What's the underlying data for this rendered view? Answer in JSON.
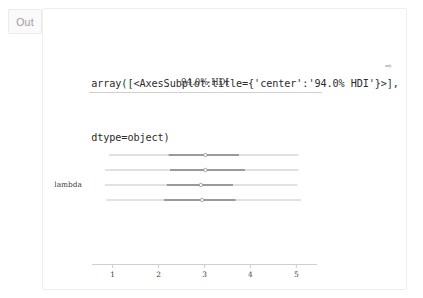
{
  "cell": {
    "prompt_label": "Out",
    "repr_lines": [
      "array([<AxesSubplot:title={'center':'94.0% HDI'}>],",
      "dtype=object)"
    ],
    "wrap_arrow_glyph": "⇨"
  },
  "chart_data": {
    "type": "forest",
    "title": "94.0% HDI",
    "xlabel": "",
    "ylabel": "lambda",
    "xlim": [
      0.55,
      5.45
    ],
    "xticks": [
      1,
      2,
      3,
      4,
      5
    ],
    "xtick_labels": [
      "1",
      "2",
      "3",
      "4",
      "5"
    ],
    "grid": false,
    "legend": "none",
    "line_color": "#bdbdbd",
    "inner_color": "#9a9a9a",
    "marker_color": "#ffffff",
    "marker_edge_color": "#8f8f8f",
    "axis_color": "#c9c9c9",
    "rows": [
      {
        "label": "lambda",
        "point_estimate": 3.02,
        "hdi_low": 0.92,
        "hdi_high": 5.05,
        "iqr_low": 2.22,
        "iqr_high": 3.75
      },
      {
        "label": "",
        "point_estimate": 3.02,
        "hdi_low": 0.83,
        "hdi_high": 5.05,
        "iqr_low": 2.25,
        "iqr_high": 3.88
      },
      {
        "label": "",
        "point_estimate": 2.92,
        "hdi_low": 0.83,
        "hdi_high": 5.02,
        "iqr_low": 2.18,
        "iqr_high": 3.62
      },
      {
        "label": "",
        "point_estimate": 2.95,
        "hdi_low": 0.86,
        "hdi_high": 5.1,
        "iqr_low": 2.12,
        "iqr_high": 3.68
      }
    ]
  }
}
